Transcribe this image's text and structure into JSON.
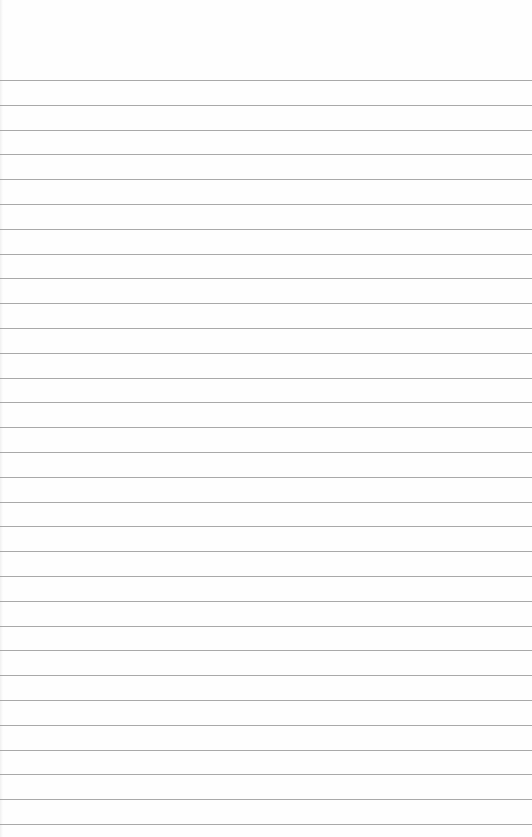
{
  "page": {
    "type": "blank ruled paper",
    "background_color": "#fefefe",
    "line_color": "#9a9a9a",
    "first_line_y": 80,
    "line_spacing": 24.8,
    "line_count": 31
  }
}
